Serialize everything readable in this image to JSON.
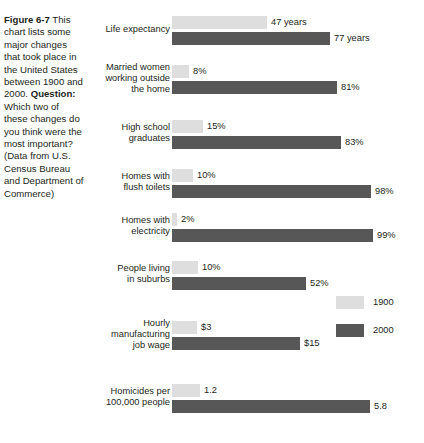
{
  "caption": {
    "figure_label": "Figure 6-7",
    "body_1": " This chart lists some major changes that took place in the United States between 1900 and 2000. ",
    "question_label": "Question:",
    "body_2": " Which two of these changes do you think were the most important? (Data from U.S. Census Bureau and Department of Commerce)"
  },
  "chart_data": {
    "type": "bar",
    "title": "",
    "xlabel": "",
    "ylabel": "",
    "orientation": "horizontal",
    "grid": false,
    "legend_position": "right",
    "legend": [
      {
        "name": "1900",
        "color": "#dedede"
      },
      {
        "name": "2000",
        "color": "#575757"
      }
    ],
    "categories": [
      "Life expectancy",
      "Married women working outside the home",
      "High school graduates",
      "Homes with flush toilets",
      "Homes with electricity",
      "People living in suburbs",
      "Hourly manufacturing job wage",
      "Homicides per 100,000 people"
    ],
    "series": [
      {
        "name": "1900",
        "values": [
          47,
          8,
          15,
          10,
          2,
          10,
          3,
          1.2
        ],
        "labels": [
          "47 years",
          "8%",
          "15%",
          "10%",
          "2%",
          "10%",
          "$3",
          "1.2"
        ]
      },
      {
        "name": "2000",
        "values": [
          77,
          81,
          83,
          98,
          99,
          52,
          15,
          5.8
        ],
        "labels": [
          "77 years",
          "81%",
          "83%",
          "98%",
          "99%",
          "52%",
          "$15",
          "5.8"
        ]
      }
    ],
    "rows": [
      {
        "category_lines": [
          "Life expectancy"
        ],
        "top": 16,
        "label_top": 24,
        "bars": [
          {
            "series": "1900",
            "label": "47 years",
            "width_px": 95
          },
          {
            "series": "2000",
            "label": "77 years",
            "width_px": 158
          }
        ]
      },
      {
        "category_lines": [
          "Married women",
          "working outside",
          "the home"
        ],
        "top": 65,
        "label_top": 62,
        "bars": [
          {
            "series": "1900",
            "label": "8%",
            "width_px": 17
          },
          {
            "series": "2000",
            "label": "81%",
            "width_px": 165
          }
        ]
      },
      {
        "category_lines": [
          "High school",
          "graduates"
        ],
        "top": 120,
        "label_top": 122,
        "bars": [
          {
            "series": "1900",
            "label": "15%",
            "width_px": 31
          },
          {
            "series": "2000",
            "label": "83%",
            "width_px": 169
          }
        ]
      },
      {
        "category_lines": [
          "Homes with",
          "flush toilets"
        ],
        "top": 169,
        "label_top": 171,
        "bars": [
          {
            "series": "1900",
            "label": "10%",
            "width_px": 21
          },
          {
            "series": "2000",
            "label": "98%",
            "width_px": 199
          }
        ]
      },
      {
        "category_lines": [
          "Homes with",
          "electricity"
        ],
        "top": 213,
        "label_top": 215,
        "bars": [
          {
            "series": "1900",
            "label": "2%",
            "width_px": 5
          },
          {
            "series": "2000",
            "label": "99%",
            "width_px": 201
          }
        ]
      },
      {
        "category_lines": [
          "People living",
          "in suburbs"
        ],
        "top": 261,
        "label_top": 263,
        "bars": [
          {
            "series": "1900",
            "label": "10%",
            "width_px": 26
          },
          {
            "series": "2000",
            "label": "52%",
            "width_px": 134
          }
        ]
      },
      {
        "category_lines": [
          "Hourly",
          "manufacturing",
          "job wage"
        ],
        "top": 321,
        "label_top": 318,
        "bars": [
          {
            "series": "1900",
            "label": "$3",
            "width_px": 25
          },
          {
            "series": "2000",
            "label": "$15",
            "width_px": 128
          }
        ]
      },
      {
        "category_lines": [
          "Homicides per",
          "100,000 people"
        ],
        "top": 384,
        "label_top": 386,
        "bars": [
          {
            "series": "1900",
            "label": "1.2",
            "width_px": 28
          },
          {
            "series": "2000",
            "label": "5.8",
            "width_px": 198
          }
        ]
      }
    ]
  }
}
